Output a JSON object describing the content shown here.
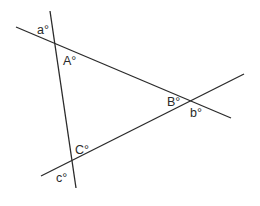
{
  "diagram": {
    "type": "triangle-with-extended-sides",
    "lines": [
      {
        "id": "line-ab",
        "x1": 16,
        "y1": 27,
        "x2": 231,
        "y2": 118
      },
      {
        "id": "line-ac",
        "x1": 50,
        "y1": 11,
        "x2": 76,
        "y2": 188
      },
      {
        "id": "line-cb",
        "x1": 41,
        "y1": 176,
        "x2": 244,
        "y2": 74
      }
    ],
    "vertices": {
      "A": {
        "x": 54,
        "y": 42
      },
      "B": {
        "x": 193,
        "y": 101
      },
      "C": {
        "x": 71,
        "y": 167
      }
    },
    "labels": {
      "a": {
        "text": "a°",
        "x": 37,
        "y": 34
      },
      "A": {
        "text": "A°",
        "x": 63,
        "y": 65
      },
      "B": {
        "text": "B°",
        "x": 167,
        "y": 106
      },
      "b": {
        "text": "b°",
        "x": 190,
        "y": 117
      },
      "C": {
        "text": "C°",
        "x": 75,
        "y": 154
      },
      "c": {
        "text": "c°",
        "x": 56,
        "y": 182
      }
    }
  }
}
